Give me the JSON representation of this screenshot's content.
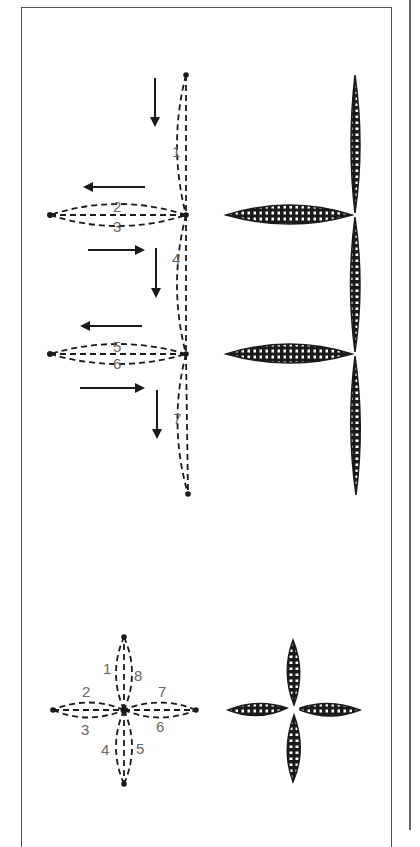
{
  "figure": {
    "type": "embroidery stitch diagram",
    "colors": {
      "ink": "#1a1a1a",
      "label": "#666666",
      "frame": "#555555",
      "background": "#ffffff"
    }
  },
  "upper_diagram": {
    "description": "Lazy daisy branch: vertical stem with two side leaves, stitch order numbered",
    "labels": [
      "1",
      "2",
      "3",
      "4",
      "5",
      "6",
      "7"
    ],
    "arrows": [
      {
        "direction": "down",
        "label": "arrow-1"
      },
      {
        "direction": "left",
        "label": "arrow-2"
      },
      {
        "direction": "right",
        "label": "arrow-3"
      },
      {
        "direction": "down",
        "label": "arrow-4"
      },
      {
        "direction": "left",
        "label": "arrow-5"
      },
      {
        "direction": "right",
        "label": "arrow-6"
      },
      {
        "direction": "down",
        "label": "arrow-7"
      }
    ]
  },
  "lower_diagram": {
    "description": "Four-petal flower stitch order",
    "labels": [
      "1",
      "2",
      "3",
      "4",
      "5",
      "6",
      "7",
      "8"
    ]
  }
}
